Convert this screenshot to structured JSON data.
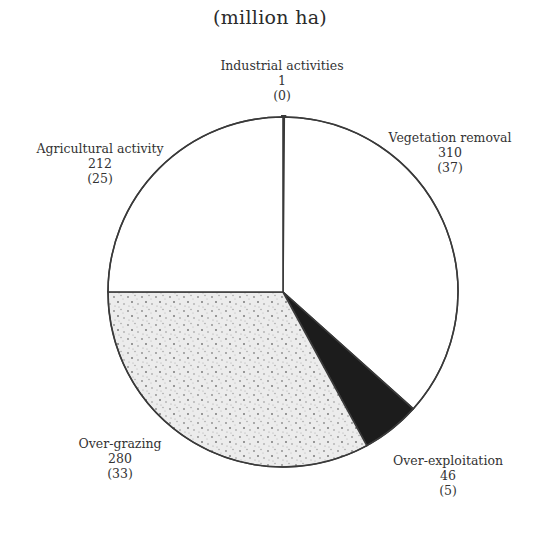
{
  "title": "(million ha)",
  "colors": {
    "background": "#ffffff",
    "outline": "#3a3a3a",
    "industrial": "#1a1a1a",
    "vegetation_removal": "#ffffff",
    "over_exploitation": "#1c1c1c",
    "over_grazing": "#e6e6e6",
    "agricultural_activity": "#ffffff"
  },
  "labels": {
    "industrial": {
      "name": "Industrial activities",
      "value": "1",
      "percent": "(0)"
    },
    "vegetation": {
      "name": "Vegetation removal",
      "value": "310",
      "percent": "(37)"
    },
    "overexploitation": {
      "name": "Over-exploitation",
      "value": "46",
      "percent": "(5)"
    },
    "overgrazing": {
      "name": "Over-grazing",
      "value": "280",
      "percent": "(33)"
    },
    "agricultural": {
      "name": "Agricultural activity",
      "value": "212",
      "percent": "(25)"
    }
  },
  "chart_data": {
    "type": "pie",
    "title": "(million ha)",
    "unit": "million ha",
    "start_angle": "12 o'clock, clockwise",
    "categories": [
      "Industrial activities",
      "Vegetation removal",
      "Over-exploitation",
      "Over-grazing",
      "Agricultural activity"
    ],
    "values": [
      1,
      310,
      46,
      280,
      212
    ],
    "percentages": [
      0,
      37,
      5,
      33,
      25
    ],
    "fills": [
      "solid black",
      "white",
      "solid black",
      "stippled grey",
      "white"
    ],
    "legend": "none (direct labels)"
  }
}
